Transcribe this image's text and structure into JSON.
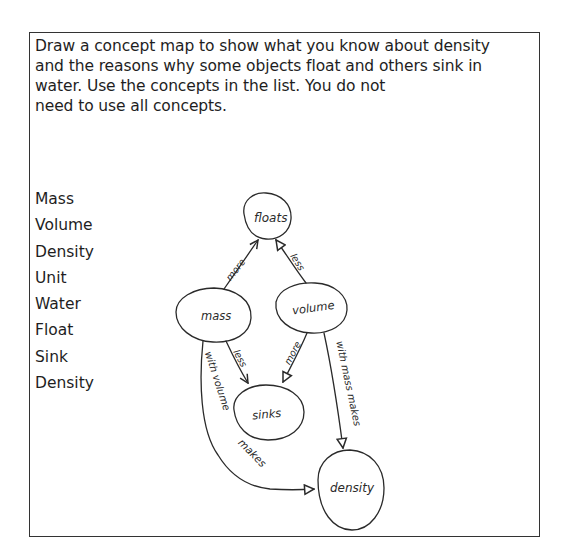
{
  "prompt": {
    "lines": [
      "Draw a concept map to show what you know about density",
      "and the reasons why some objects float and others sink in",
      "water. Use the concepts in the list. You do not",
      "need to use all concepts."
    ]
  },
  "concept_list": [
    "Mass",
    "Volume",
    "Density",
    "Unit",
    "Water",
    "Float",
    "Sink",
    "Density"
  ],
  "concept_map": {
    "nodes": {
      "floats": "floats",
      "mass": "mass",
      "volume": "volume",
      "sinks": "sinks",
      "density": "density"
    },
    "links": {
      "mass_floats": "more",
      "volume_floats": "less",
      "mass_sinks": "less",
      "volume_sinks": "more",
      "volume_density": "with mass makes",
      "mass_density_1": "with volume",
      "mass_density_2": "makes"
    }
  }
}
